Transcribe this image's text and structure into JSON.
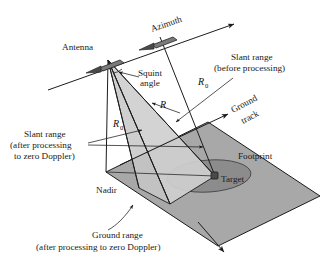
{
  "figure": {
    "type": "technical-line-diagram"
  },
  "labels": {
    "azimuth": "Azimuth",
    "antenna": "Antenna",
    "squint_angle_line1": "Squint",
    "squint_angle_line2": "angle",
    "slant_before_line1": "Slant range",
    "slant_before_line2": "(before processing)",
    "ground_track_line1": "Ground",
    "ground_track_line2": "track",
    "footprint": "Footprint",
    "target": "Target",
    "nadir": "Nadir",
    "slant_after_line1": "Slant range",
    "slant_after_line2": "(after processing",
    "slant_after_line3": "to zero Doppler)",
    "ground_range_line1": "Ground range",
    "ground_range_line2": "(after processing to zero Doppler)"
  },
  "math_symbols": {
    "r_zero_upper": "R",
    "r_zero_upper_sub": "0",
    "r_slant": "R",
    "r_zero_lower": "R",
    "r_zero_lower_sub": "0"
  },
  "colors": {
    "ground_plane": "#a8a8a8",
    "footprint_ellipse": "#8c8c8c",
    "beam_triangle": "#cfcfcf",
    "line": "#1c1c1c",
    "antenna_body": "#7a7a7a",
    "antenna_arrow": "#4a4a4a",
    "target_marker": "#4a4a4a",
    "background": "#ffffff"
  },
  "geometry": {
    "antenna_primary": [
      108,
      60
    ],
    "antenna_secondary": [
      160,
      37
    ],
    "azimuth_arrow_tip": [
      237,
      22
    ],
    "nadir_point": [
      106,
      172
    ],
    "target_point": [
      215,
      176
    ],
    "ground_track_arrow_tip": [
      232,
      113
    ],
    "ground_range_arrow_tip": [
      226,
      254
    ]
  }
}
